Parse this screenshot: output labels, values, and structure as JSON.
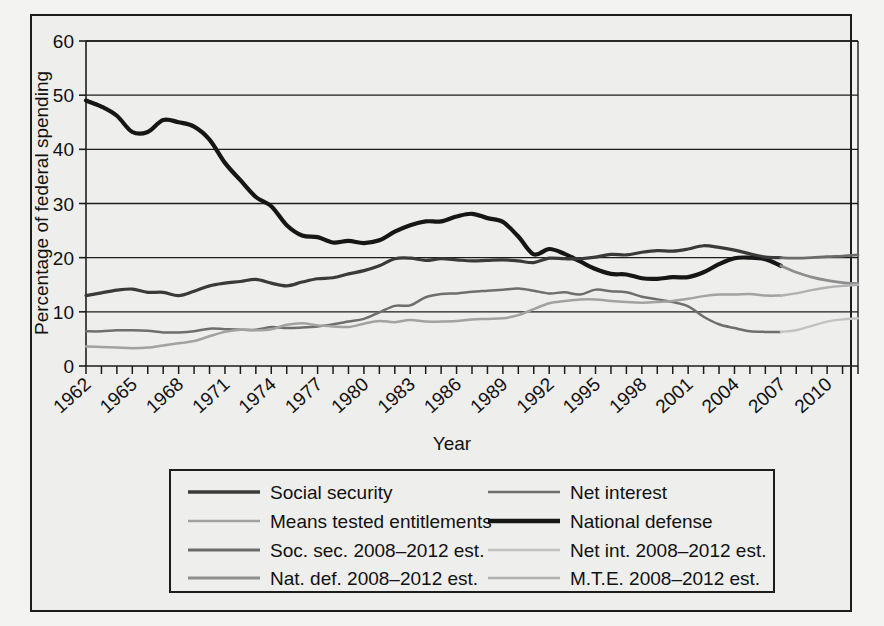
{
  "figure": {
    "background_color": "#eeeeec",
    "border_color": "#1d1d1d",
    "cropped_caption_fragment": ""
  },
  "chart_data": {
    "type": "line",
    "title": "",
    "xlabel": "Year",
    "ylabel": "Percentage of federal spending",
    "xlim": [
      1962,
      2012
    ],
    "ylim": [
      0,
      60
    ],
    "ytick_step": 10,
    "yticks": [
      0,
      10,
      20,
      30,
      40,
      50,
      60
    ],
    "xticks_labeled": [
      1962,
      1965,
      1968,
      1971,
      1974,
      1977,
      1980,
      1983,
      1986,
      1989,
      1992,
      1995,
      1998,
      2001,
      2004,
      2007,
      2010
    ],
    "xtick_interval_minor": 1,
    "grid": "horizontal",
    "legend_position": "below-axes",
    "x": [
      1962,
      1963,
      1964,
      1965,
      1966,
      1967,
      1968,
      1969,
      1970,
      1971,
      1972,
      1973,
      1974,
      1975,
      1976,
      1977,
      1978,
      1979,
      1980,
      1981,
      1982,
      1983,
      1984,
      1985,
      1986,
      1987,
      1988,
      1989,
      1990,
      1991,
      1992,
      1993,
      1994,
      1995,
      1996,
      1997,
      1998,
      1999,
      2000,
      2001,
      2002,
      2003,
      2004,
      2005,
      2006,
      2007
    ],
    "x_est": [
      2007,
      2008,
      2009,
      2010,
      2011,
      2012
    ],
    "series": [
      {
        "name": "National defense",
        "key": "national_defense",
        "color": "#161616",
        "width": 4.2,
        "values": [
          49.0,
          47.9,
          46.2,
          43.2,
          43.2,
          45.4,
          45.0,
          44.2,
          41.8,
          37.5,
          34.3,
          31.2,
          29.5,
          26.0,
          24.1,
          23.8,
          22.8,
          23.1,
          22.7,
          23.2,
          24.8,
          26.0,
          26.7,
          26.7,
          27.6,
          28.1,
          27.3,
          26.6,
          23.9,
          20.6,
          21.6,
          20.7,
          19.3,
          17.9,
          17.0,
          16.9,
          16.2,
          16.1,
          16.4,
          16.4,
          17.3,
          18.8,
          19.9,
          20.0,
          19.7,
          18.5
        ]
      },
      {
        "name": "Social security",
        "key": "social_security",
        "color": "#3a3a3a",
        "width": 3.2,
        "values": [
          13.0,
          13.5,
          14.0,
          14.2,
          13.6,
          13.6,
          13.0,
          13.8,
          14.8,
          15.3,
          15.6,
          16.0,
          15.3,
          14.8,
          15.5,
          16.1,
          16.3,
          17.0,
          17.6,
          18.5,
          19.8,
          19.9,
          19.5,
          19.8,
          19.6,
          19.4,
          19.5,
          19.6,
          19.4,
          19.1,
          19.9,
          19.8,
          19.8,
          20.1,
          20.6,
          20.5,
          21.0,
          21.3,
          21.2,
          21.6,
          22.2,
          21.9,
          21.4,
          20.7,
          20.1,
          20.0
        ]
      },
      {
        "name": "Net interest",
        "key": "net_interest",
        "color": "#6e6e6e",
        "width": 2.5,
        "values": [
          6.4,
          6.4,
          6.6,
          6.6,
          6.5,
          6.2,
          6.2,
          6.4,
          6.9,
          6.8,
          6.7,
          6.7,
          7.2,
          7.0,
          7.1,
          7.3,
          7.7,
          8.2,
          8.7,
          9.9,
          11.1,
          11.2,
          12.7,
          13.3,
          13.4,
          13.7,
          13.9,
          14.1,
          14.3,
          13.9,
          13.4,
          13.6,
          13.2,
          14.1,
          13.8,
          13.6,
          12.8,
          12.3,
          11.8,
          11.0,
          9.1,
          7.7,
          7.0,
          6.4,
          6.3,
          6.3
        ]
      },
      {
        "name": "Means tested entitlements",
        "key": "means_tested_entitlements",
        "color": "#a2a2a2",
        "width": 2.5,
        "values": [
          3.6,
          3.5,
          3.4,
          3.3,
          3.4,
          3.8,
          4.2,
          4.6,
          5.5,
          6.3,
          6.7,
          6.6,
          6.8,
          7.6,
          7.9,
          7.5,
          7.3,
          7.2,
          7.8,
          8.3,
          8.1,
          8.5,
          8.2,
          8.2,
          8.3,
          8.6,
          8.7,
          8.8,
          9.4,
          10.5,
          11.6,
          12.0,
          12.3,
          12.3,
          12.0,
          11.8,
          11.7,
          11.8,
          12.0,
          12.4,
          12.9,
          13.2,
          13.2,
          13.3,
          13.0,
          13.0
        ]
      }
    ],
    "series_estimates": [
      {
        "name": "Soc. sec. 2008–2012 est.",
        "key": "soc_sec_est",
        "color": "#6b6b6b",
        "width": 2.8,
        "values": [
          20.0,
          19.9,
          20.0,
          20.2,
          20.3,
          20.5
        ]
      },
      {
        "name": "Nat. def. 2008–2012 est.",
        "key": "nat_def_est",
        "color": "#8e8e8e",
        "width": 2.8,
        "values": [
          18.5,
          17.3,
          16.4,
          15.8,
          15.4,
          15.2
        ]
      },
      {
        "name": "Net int. 2008–2012 est.",
        "key": "net_int_est",
        "color": "#c2c2c2",
        "width": 2.4,
        "values": [
          6.3,
          6.6,
          7.4,
          8.2,
          8.6,
          8.8
        ]
      },
      {
        "name": "M.T.E. 2008–2012 est.",
        "key": "mte_est",
        "color": "#b0b0b0",
        "width": 2.4,
        "values": [
          13.0,
          13.4,
          14.0,
          14.5,
          14.8,
          15.0
        ]
      }
    ],
    "legend_entries": [
      {
        "label": "Social security",
        "color": "#3a3a3a",
        "width": 3.4
      },
      {
        "label": "Net interest",
        "color": "#6e6e6e",
        "width": 2.6
      },
      {
        "label": "Means tested entitlements",
        "color": "#a2a2a2",
        "width": 2.6
      },
      {
        "label": "National defense",
        "color": "#161616",
        "width": 4.4
      },
      {
        "label": "Soc. sec. 2008–2012 est.",
        "color": "#6b6b6b",
        "width": 3.0
      },
      {
        "label": "Net int. 2008–2012 est.",
        "color": "#c2c2c2",
        "width": 2.4
      },
      {
        "label": "Nat. def. 2008–2012 est.",
        "color": "#8e8e8e",
        "width": 3.0
      },
      {
        "label": "M.T.E. 2008–2012 est.",
        "color": "#b0b0b0",
        "width": 2.4
      }
    ]
  }
}
